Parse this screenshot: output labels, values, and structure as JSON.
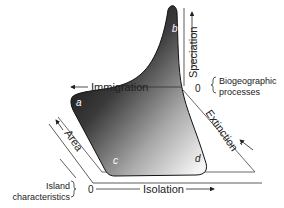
{
  "diagram": {
    "axes": {
      "immigration": "Immigration",
      "speciation": "Speciation",
      "extinction": "Extinction",
      "area": "Area",
      "isolation": "Isolation",
      "origin_top": "0",
      "origin_bottom": "0"
    },
    "groups": {
      "biogeographic_line1": "Biogeographic",
      "biogeographic_line2": "processes",
      "island_line1": "Island",
      "island_line2": "characteristics"
    },
    "points": {
      "a": "a",
      "b": "b",
      "c": "c",
      "d": "d"
    },
    "colors": {
      "surface_dark": "#111111",
      "surface_light": "#f2f2f2",
      "axis": "#333333",
      "text": "#222222"
    }
  }
}
